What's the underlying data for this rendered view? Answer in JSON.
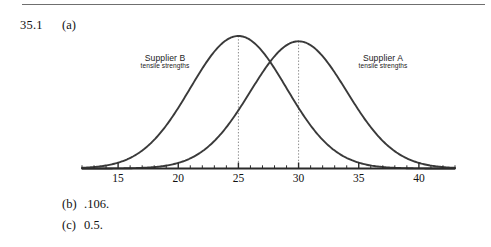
{
  "page": {
    "question_number": "35.1",
    "part_a_label": "(a)",
    "answers": [
      {
        "label": "(b)",
        "value": ".106."
      },
      {
        "label": "(c)",
        "value": "0.5."
      }
    ]
  },
  "figure": {
    "curve_label_b": {
      "title": "Supplier B",
      "subtitle": "tensile strengths"
    },
    "curve_label_a": {
      "title": "Supplier A",
      "subtitle": "tensile strengths"
    },
    "axis": {
      "tick_labels": [
        "15",
        "20",
        "25",
        "30",
        "35",
        "40"
      ]
    },
    "colors": {
      "curve": "#3a3a3a",
      "axis": "#2b2b2b",
      "guide": "#8a8a8a",
      "rule": "#6f6f6f"
    }
  },
  "chart_data": {
    "type": "line",
    "title": "",
    "xlabel": "",
    "ylabel": "",
    "xlim": [
      12,
      43
    ],
    "ylim": [
      0,
      1
    ],
    "grid": false,
    "legend": "inline-annotations",
    "x_ticks_major": [
      15,
      20,
      25,
      30,
      35,
      40
    ],
    "x_ticks_minor_step": 1,
    "x_tick_labels": [
      "15",
      "20",
      "25",
      "30",
      "35",
      "40"
    ],
    "series": [
      {
        "name": "Supplier B tensile strengths",
        "distribution": "normal",
        "mean": 25,
        "std": 4,
        "peak_x": 25,
        "peak_y": 1.0,
        "annotation": "Supplier B\ntensile strengths",
        "guide_line_x": 25
      },
      {
        "name": "Supplier A tensile strengths",
        "distribution": "normal",
        "mean": 30,
        "std": 4,
        "peak_x": 30,
        "peak_y": 0.96,
        "annotation": "Supplier A\ntensile strengths",
        "guide_line_x": 30
      }
    ]
  }
}
